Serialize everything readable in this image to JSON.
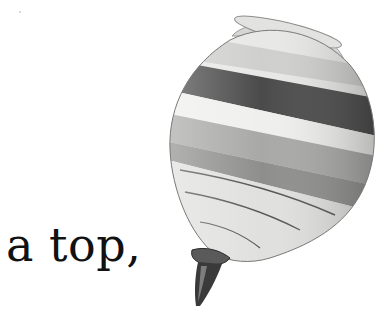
{
  "caption": {
    "text": "a top,"
  },
  "illustration": {
    "subject": "spinning-top",
    "description": "Grayscale photo of a wooden spinning top with horizontal painted bands, tilted, with metal tip at bottom",
    "colors": {
      "body_light": "#e8e8e6",
      "body_mid": "#bdbdbb",
      "band_dark": "#4a4a4a",
      "band_medium": "#8e8e8c",
      "rim": "#d6d6d4",
      "tip_metal": "#3a3a3a",
      "groove": "#555555"
    }
  }
}
